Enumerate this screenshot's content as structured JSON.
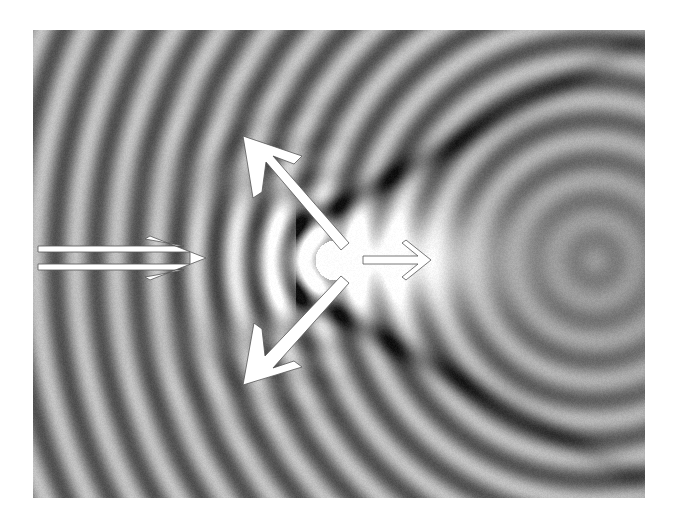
{
  "figure": {
    "title": "",
    "colors": {
      "background": "#ffffff",
      "field_mid": "#8a8a8a",
      "field_dark": "#1a1a1a",
      "field_light": "#ffffff",
      "arrow_fill": "#ffffff",
      "arrow_outline": "#555555"
    },
    "arrows": [
      {
        "id": "incident",
        "semantic": "incident-wave-arrow",
        "style": "double-shaft",
        "direction": "right"
      },
      {
        "id": "scatter-up",
        "semantic": "scattered-wave-up-left-arrow",
        "style": "solid",
        "direction": "up-left"
      },
      {
        "id": "scatter-down",
        "semantic": "scattered-wave-down-left-arrow",
        "style": "solid",
        "direction": "down-left"
      },
      {
        "id": "forward",
        "semantic": "transmitted-wave-arrow",
        "style": "outline",
        "direction": "right"
      }
    ],
    "field": {
      "fringe_type": "concentric-arcs",
      "bright_spot": "behind-obstacle-center-right",
      "shadow_cone": "dark-bands-opening-rightward"
    }
  }
}
